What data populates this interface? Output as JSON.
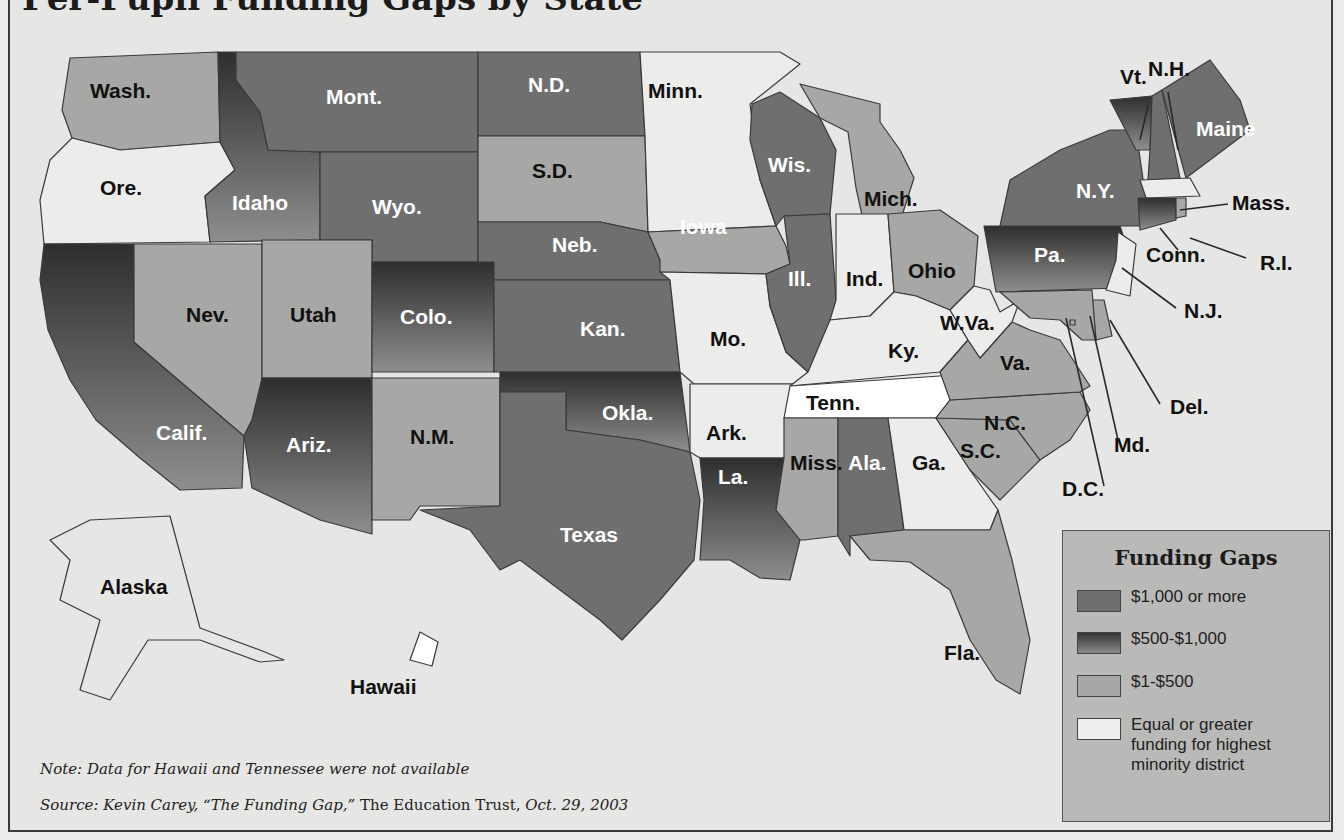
{
  "title": "Per-Pupil Funding Gaps by State",
  "legend": {
    "title": "Funding Gaps",
    "items": [
      {
        "key": "high",
        "label": "$1,000 or more",
        "color": "#6f6f6f",
        "gradient": false
      },
      {
        "key": "mid",
        "label": "$500-$1,000",
        "color": "#3e3e3e",
        "color_end": "#8a8a8a",
        "gradient": true
      },
      {
        "key": "low",
        "label": "$1-$500",
        "color": "#a7a7a5",
        "gradient": false
      },
      {
        "key": "none",
        "label": "Equal or greater funding for highest minority district",
        "color": "#eeeeec",
        "gradient": false
      }
    ]
  },
  "note": "Note: Data for Hawaii and Tennessee were not available",
  "source": {
    "prefix": "Source: Kevin Carey, “The Funding Gap,”",
    "publisher": " The Education Trust, ",
    "date": "Oct. 29, 2003"
  },
  "states": [
    {
      "name": "Wash.",
      "category": "low"
    },
    {
      "name": "Ore.",
      "category": "none"
    },
    {
      "name": "Calif.",
      "category": "mid"
    },
    {
      "name": "Nev.",
      "category": "low"
    },
    {
      "name": "Idaho",
      "category": "mid"
    },
    {
      "name": "Mont.",
      "category": "high"
    },
    {
      "name": "Wyo.",
      "category": "high"
    },
    {
      "name": "Utah",
      "category": "low"
    },
    {
      "name": "Colo.",
      "category": "mid"
    },
    {
      "name": "Ariz.",
      "category": "mid"
    },
    {
      "name": "N.M.",
      "category": "low"
    },
    {
      "name": "N.D.",
      "category": "high"
    },
    {
      "name": "S.D.",
      "category": "low"
    },
    {
      "name": "Neb.",
      "category": "high"
    },
    {
      "name": "Kan.",
      "category": "high"
    },
    {
      "name": "Okla.",
      "category": "mid"
    },
    {
      "name": "Texas",
      "category": "high"
    },
    {
      "name": "Minn.",
      "category": "none"
    },
    {
      "name": "Iowa",
      "category": "low"
    },
    {
      "name": "Mo.",
      "category": "none"
    },
    {
      "name": "Ark.",
      "category": "none"
    },
    {
      "name": "La.",
      "category": "mid"
    },
    {
      "name": "Wis.",
      "category": "high"
    },
    {
      "name": "Ill.",
      "category": "high"
    },
    {
      "name": "Mich.",
      "category": "low"
    },
    {
      "name": "Ind.",
      "category": "none"
    },
    {
      "name": "Ohio",
      "category": "low"
    },
    {
      "name": "Ky.",
      "category": "none"
    },
    {
      "name": "Tenn.",
      "category": "na"
    },
    {
      "name": "Miss.",
      "category": "low"
    },
    {
      "name": "Ala.",
      "category": "high"
    },
    {
      "name": "Ga.",
      "category": "none"
    },
    {
      "name": "Fla.",
      "category": "low"
    },
    {
      "name": "S.C.",
      "category": "low"
    },
    {
      "name": "N.C.",
      "category": "low"
    },
    {
      "name": "Va.",
      "category": "low"
    },
    {
      "name": "W.Va.",
      "category": "none"
    },
    {
      "name": "Pa.",
      "category": "mid"
    },
    {
      "name": "N.Y.",
      "category": "high"
    },
    {
      "name": "Vt.",
      "category": "mid"
    },
    {
      "name": "N.H.",
      "category": "high"
    },
    {
      "name": "Maine",
      "category": "high"
    },
    {
      "name": "Mass.",
      "category": "none"
    },
    {
      "name": "Conn.",
      "category": "mid"
    },
    {
      "name": "R.I.",
      "category": "low"
    },
    {
      "name": "N.J.",
      "category": "none"
    },
    {
      "name": "Del.",
      "category": "low"
    },
    {
      "name": "Md.",
      "category": "low"
    },
    {
      "name": "D.C.",
      "category": "low"
    },
    {
      "name": "Alaska",
      "category": "none"
    },
    {
      "name": "Hawaii",
      "category": "na"
    }
  ]
}
